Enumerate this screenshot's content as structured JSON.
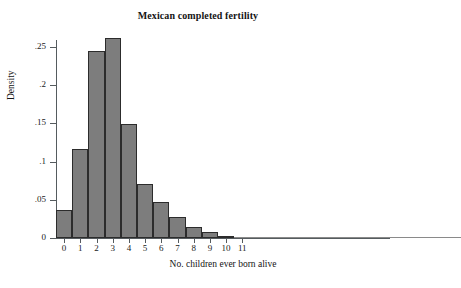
{
  "chart_data": {
    "type": "bar",
    "title": "Mexican completed fertility",
    "xlabel": "No. children ever born alive",
    "ylabel": "Density",
    "categories": [
      "0",
      "1",
      "2",
      "3",
      "4",
      "5",
      "6",
      "7",
      "8",
      "9",
      "10",
      "11",
      "12",
      "13",
      "14",
      "15",
      "16",
      "17",
      "18",
      "19",
      "20",
      "21",
      "22",
      "23",
      "24"
    ],
    "values": [
      0.037,
      0.117,
      0.245,
      0.262,
      0.149,
      0.071,
      0.047,
      0.028,
      0.015,
      0.008,
      0.003,
      0.0012,
      0.0006,
      0.0004,
      0.0003,
      0.0002,
      0.0002,
      0.0001,
      0.0001,
      0.0001,
      0.0004,
      0.0004,
      0.0004,
      0.0004,
      0.0003
    ],
    "xtick_labels": [
      "0",
      "1",
      "2",
      "3",
      "4",
      "5",
      "6",
      "7",
      "8",
      "9",
      "10",
      "11"
    ],
    "ytick_labels": [
      "0",
      ".05",
      ".1",
      ".15",
      ".2",
      ".25"
    ],
    "ytick_values": [
      0,
      0.05,
      0.1,
      0.15,
      0.2,
      0.25
    ],
    "ylim": [
      0,
      0.275
    ],
    "xlim": [
      -0.5,
      24.5
    ],
    "grid": false,
    "legend": "none",
    "bar_color": "#7d7d7d",
    "bar_edge_color": "#2c2c2c",
    "axis_color": "#555b5e",
    "background": "#ffffff"
  }
}
